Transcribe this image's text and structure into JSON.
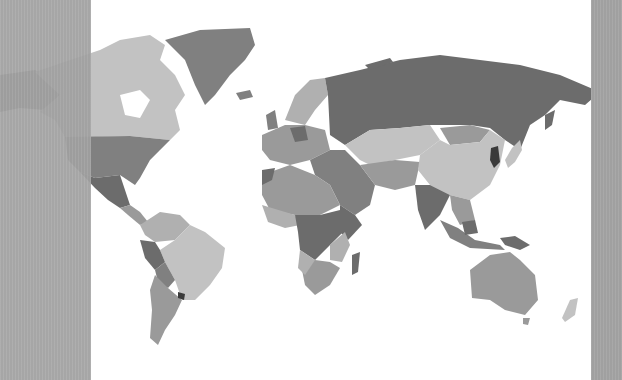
{
  "map": {
    "type": "choropleth-world-map",
    "color_scheme": "grayscale",
    "background": "#ffffff",
    "shades": {
      "lightest": "#c2c2c2",
      "light": "#b0b0b0",
      "medium": "#9a9a9a",
      "dark": "#808080",
      "darker": "#6c6c6c",
      "darkest": "#3a3a3a"
    },
    "regions": [
      {
        "name": "Greenland",
        "shade": "dark"
      },
      {
        "name": "Canada",
        "shade": "lightest"
      },
      {
        "name": "United States",
        "shade": "dark"
      },
      {
        "name": "Alaska",
        "shade": "dark"
      },
      {
        "name": "Mexico",
        "shade": "darker"
      },
      {
        "name": "Central America",
        "shade": "medium"
      },
      {
        "name": "Brazil",
        "shade": "lightest"
      },
      {
        "name": "Peru",
        "shade": "darker"
      },
      {
        "name": "Bolivia",
        "shade": "dark"
      },
      {
        "name": "Argentina",
        "shade": "medium"
      },
      {
        "name": "Chile",
        "shade": "medium"
      },
      {
        "name": "Russia",
        "shade": "darker"
      },
      {
        "name": "Scandinavia",
        "shade": "light"
      },
      {
        "name": "Western Europe",
        "shade": "medium"
      },
      {
        "name": "Middle East",
        "shade": "dark"
      },
      {
        "name": "Kazakhstan / Central Asia",
        "shade": "lightest"
      },
      {
        "name": "China",
        "shade": "lightest"
      },
      {
        "name": "Mongolia",
        "shade": "medium"
      },
      {
        "name": "India",
        "shade": "darker"
      },
      {
        "name": "Southeast Asia",
        "shade": "medium"
      },
      {
        "name": "Korea",
        "shade": "darkest"
      },
      {
        "name": "Japan",
        "shade": "lightest"
      },
      {
        "name": "North Africa",
        "shade": "medium"
      },
      {
        "name": "Central Africa",
        "shade": "darker"
      },
      {
        "name": "Southern Africa",
        "shade": "medium"
      },
      {
        "name": "Madagascar",
        "shade": "darker"
      },
      {
        "name": "Indonesia",
        "shade": "dark"
      },
      {
        "name": "Papua New Guinea",
        "shade": "darker"
      },
      {
        "name": "Australia",
        "shade": "medium"
      },
      {
        "name": "New Zealand",
        "shade": "lightest"
      }
    ]
  },
  "panels": {
    "left": {
      "color": "#a5a5a5"
    },
    "right": {
      "color": "#a5a5a5"
    }
  }
}
